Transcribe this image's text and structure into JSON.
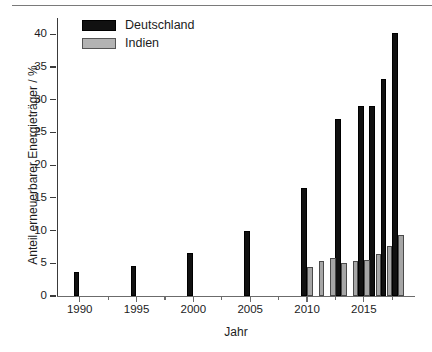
{
  "chart_data": {
    "type": "bar",
    "title": "",
    "xlabel": "Jahr",
    "ylabel": "Anteil erneuerbarer Energieträger / %",
    "grid": false,
    "legend_position": "top-left",
    "xlim": [
      1988,
      2019.5
    ],
    "ylim": [
      0,
      42.5
    ],
    "ytick_labels": [
      "0",
      "5",
      "10",
      "15",
      "20",
      "25",
      "30",
      "35",
      "40"
    ],
    "ytick_values": [
      0,
      5,
      10,
      15,
      20,
      25,
      30,
      35,
      40
    ],
    "xtick_labels": [
      "1990",
      "1995",
      "2000",
      "2005",
      "2010",
      "2015"
    ],
    "xtick_values": [
      1990,
      1995,
      2000,
      2005,
      2010,
      2015
    ],
    "series": [
      {
        "name": "Deutschland",
        "color": "#111111",
        "points": [
          {
            "x": 1990,
            "y": 3.6
          },
          {
            "x": 1995,
            "y": 4.6
          },
          {
            "x": 2000,
            "y": 6.5
          },
          {
            "x": 2005,
            "y": 10.0
          },
          {
            "x": 2010,
            "y": 16.5
          },
          {
            "x": 2013,
            "y": 27.1
          },
          {
            "x": 2015,
            "y": 29.0
          },
          {
            "x": 2016,
            "y": 29.0
          },
          {
            "x": 2017,
            "y": 33.2
          },
          {
            "x": 2018,
            "y": 40.2
          }
        ]
      },
      {
        "name": "Indien",
        "color": "#a6a6a6",
        "points": [
          {
            "x": 2010,
            "y": 4.5
          },
          {
            "x": 2011,
            "y": 5.4
          },
          {
            "x": 2012,
            "y": 5.8
          },
          {
            "x": 2013,
            "y": 5.1
          },
          {
            "x": 2014,
            "y": 5.4
          },
          {
            "x": 2015,
            "y": 5.5
          },
          {
            "x": 2016,
            "y": 6.4
          },
          {
            "x": 2017,
            "y": 7.7
          },
          {
            "x": 2018,
            "y": 9.4
          }
        ]
      }
    ]
  },
  "legend": {
    "items": [
      {
        "label": "Deutschland",
        "style": "de"
      },
      {
        "label": "Indien",
        "style": "in"
      }
    ]
  }
}
